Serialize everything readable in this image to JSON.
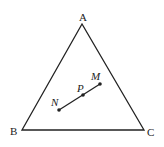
{
  "diagram": {
    "type": "geometry",
    "stroke_color": "#222222",
    "background": "#ffffff",
    "triangle": {
      "vertices": {
        "A": {
          "label": "A",
          "x": 82,
          "y": 24
        },
        "B": {
          "label": "B",
          "x": 22,
          "y": 130
        },
        "C": {
          "label": "C",
          "x": 144,
          "y": 130
        }
      }
    },
    "segment": {
      "from": "N",
      "to": "M",
      "points": {
        "M": {
          "label": "M",
          "x": 100,
          "y": 84
        },
        "P": {
          "label": "P",
          "x": 83,
          "y": 95
        },
        "N": {
          "label": "N",
          "x": 59,
          "y": 110
        }
      }
    }
  }
}
